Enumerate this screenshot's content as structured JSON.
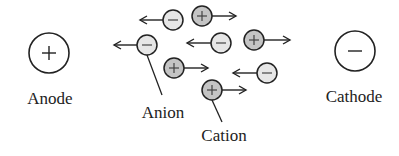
{
  "diagram": {
    "anode": {
      "label": "Anode",
      "symbol": "+",
      "cx": 49,
      "cy": 53,
      "r": 20,
      "label_x": 50,
      "label_y": 104
    },
    "cathode": {
      "label": "Cathode",
      "symbol": "−",
      "cx": 355,
      "cy": 51,
      "r": 20,
      "label_x": 354,
      "label_y": 102
    },
    "anion_label": {
      "text": "Anion",
      "x": 163,
      "y": 118
    },
    "cation_label": {
      "text": "Cation",
      "x": 224,
      "y": 141
    },
    "colors": {
      "anion_fill": "#e6e6e6",
      "cation_fill": "#c4c4c4",
      "stroke": "#222222"
    },
    "ions": [
      {
        "type": "anion",
        "symbol": "−",
        "cx": 173,
        "cy": 20,
        "arrow_to": 140
      },
      {
        "type": "anion",
        "symbol": "−",
        "cx": 147,
        "cy": 45,
        "arrow_to": 114
      },
      {
        "type": "anion",
        "symbol": "−",
        "cx": 221,
        "cy": 43,
        "arrow_to": 187
      },
      {
        "type": "anion",
        "symbol": "−",
        "cx": 267,
        "cy": 73,
        "arrow_to": 233
      },
      {
        "type": "cation",
        "symbol": "+",
        "cx": 202,
        "cy": 16,
        "arrow_to": 236
      },
      {
        "type": "cation",
        "symbol": "+",
        "cx": 254,
        "cy": 40,
        "arrow_to": 290
      },
      {
        "type": "cation",
        "symbol": "+",
        "cx": 174,
        "cy": 68,
        "arrow_to": 208
      },
      {
        "type": "cation",
        "symbol": "+",
        "cx": 212,
        "cy": 90,
        "arrow_to": 246
      }
    ],
    "leaders": [
      {
        "name": "anion-leader",
        "x1": 147,
        "y1": 55,
        "x2": 162,
        "y2": 95
      },
      {
        "name": "cation-leader",
        "x1": 212,
        "y1": 100,
        "x2": 222,
        "y2": 122
      }
    ],
    "ion_radius": 10
  }
}
